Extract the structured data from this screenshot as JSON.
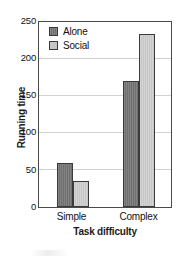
{
  "chart_data": {
    "type": "bar",
    "title": "",
    "xlabel": "Task difficulty",
    "ylabel": "Running time",
    "categories": [
      "Simple",
      "Complex"
    ],
    "series": [
      {
        "name": "Alone",
        "color": "#6f6f6f",
        "values": [
          59,
          170
        ]
      },
      {
        "name": "Social",
        "color": "#c6c6c6",
        "values": [
          35,
          234
        ]
      }
    ],
    "ylim": [
      0,
      250
    ],
    "yticks": [
      250,
      200,
      150,
      100,
      50,
      0
    ],
    "ytick_labels": [
      "250",
      "200",
      "150",
      "100",
      "50",
      "0"
    ],
    "grid": true,
    "grid_axis": "y",
    "legend_position": "top-left-inside",
    "frame": true,
    "background": "#ffffff",
    "axis_color": "#4a4a4a",
    "grid_color": "#d2d2d2"
  },
  "legend": {
    "items": [
      {
        "label": "Alone"
      },
      {
        "label": "Social"
      }
    ]
  },
  "axes": {
    "y_title": "Running time",
    "x_title": "Task difficulty",
    "y_tick_0": "250",
    "y_tick_1": "200",
    "y_tick_2": "150",
    "y_tick_3": "100",
    "y_tick_4": "50",
    "y_tick_5": "0",
    "x_tick_0": "Simple",
    "x_tick_1": "Complex"
  }
}
